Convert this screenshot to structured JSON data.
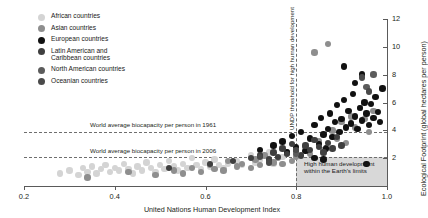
{
  "legend": {
    "items": [
      {
        "label": "African countries",
        "color": "#d4d4d4"
      },
      {
        "label": "Asian countries",
        "color": "#8e8e8e"
      },
      {
        "label": "European countries",
        "color": "#111111"
      },
      {
        "label": "Latin American and\nCaribbean countries",
        "color": "#3f3f3f"
      },
      {
        "label": "North American countries",
        "color": "#5c5c5c"
      },
      {
        "label": "Oceanian countries",
        "color": "#4a4a4a"
      }
    ]
  },
  "annotations": {
    "biocapacity_1961": "World average biocapacity per person in 1961",
    "biocapacity_2006": "World average biocapacity per person in 2006",
    "undp_threshold": "UNDP threshold for high human development",
    "sustainable_box": "High human development\nwithin the Earth's limits"
  },
  "chart_data": {
    "type": "scatter",
    "title": "",
    "xlabel": "United Nations Human Development Index",
    "ylabel": "Ecological Footprint (global hectares per person)",
    "xlim": [
      0.2,
      1.0
    ],
    "ylim": [
      0,
      12
    ],
    "xticks": [
      "0.2",
      "0.4",
      "0.6",
      "0.8",
      "1.0"
    ],
    "xtick_values": [
      0.2,
      0.4,
      0.6,
      0.8,
      1.0
    ],
    "yticks": [
      "2",
      "4",
      "6",
      "8",
      "10",
      "12"
    ],
    "ytick_values": [
      2,
      4,
      6,
      8,
      10,
      12
    ],
    "grid": false,
    "legend_position": "top-left",
    "reference_lines": [
      {
        "name": "World average biocapacity per person in 1961",
        "axis": "y",
        "value": 3.9,
        "style": "dashed"
      },
      {
        "name": "World average biocapacity per person in 2006",
        "axis": "y",
        "value": 2.1,
        "style": "dashed"
      },
      {
        "name": "UNDP threshold for high human development",
        "axis": "x",
        "value": 0.8,
        "style": "dashed"
      }
    ],
    "shaded_region": {
      "label": "High human development within the Earth's limits",
      "x_range": [
        0.8,
        1.0
      ],
      "y_range": [
        0,
        2.1
      ],
      "color": "#c9c9c9"
    },
    "series": [
      {
        "name": "African countries",
        "color": "#d4d4d4",
        "points": [
          [
            0.28,
            0.9
          ],
          [
            0.3,
            1.1
          ],
          [
            0.32,
            0.8
          ],
          [
            0.33,
            1.3
          ],
          [
            0.34,
            1.0
          ],
          [
            0.35,
            1.4
          ],
          [
            0.36,
            0.9
          ],
          [
            0.37,
            1.2
          ],
          [
            0.38,
            1.5
          ],
          [
            0.39,
            1.0
          ],
          [
            0.4,
            1.3
          ],
          [
            0.41,
            1.1
          ],
          [
            0.42,
            1.6
          ],
          [
            0.43,
            1.2
          ],
          [
            0.44,
            0.9
          ],
          [
            0.45,
            1.4
          ],
          [
            0.46,
            1.1
          ],
          [
            0.47,
            1.7
          ],
          [
            0.48,
            1.3
          ],
          [
            0.49,
            1.0
          ],
          [
            0.5,
            1.5
          ],
          [
            0.51,
            1.2
          ],
          [
            0.52,
            1.8
          ],
          [
            0.53,
            1.4
          ],
          [
            0.54,
            1.1
          ],
          [
            0.55,
            1.6
          ],
          [
            0.56,
            1.3
          ],
          [
            0.57,
            2.0
          ],
          [
            0.58,
            1.5
          ],
          [
            0.59,
            1.2
          ],
          [
            0.6,
            1.7
          ],
          [
            0.61,
            1.4
          ],
          [
            0.62,
            1.9
          ],
          [
            0.63,
            1.5
          ],
          [
            0.64,
            1.3
          ],
          [
            0.65,
            1.6
          ],
          [
            0.67,
            1.8
          ],
          [
            0.68,
            1.5
          ],
          [
            0.7,
            2.2
          ],
          [
            0.71,
            1.7
          ],
          [
            0.72,
            1.9
          ],
          [
            0.74,
            2.4
          ],
          [
            0.75,
            1.6
          ],
          [
            0.77,
            2.1
          ],
          [
            0.8,
            2.6
          ]
        ]
      },
      {
        "name": "Asian countries",
        "color": "#8e8e8e",
        "points": [
          [
            0.34,
            0.6
          ],
          [
            0.43,
            1.0
          ],
          [
            0.49,
            0.8
          ],
          [
            0.53,
            1.1
          ],
          [
            0.55,
            0.9
          ],
          [
            0.57,
            1.3
          ],
          [
            0.59,
            1.0
          ],
          [
            0.61,
            1.5
          ],
          [
            0.62,
            1.2
          ],
          [
            0.64,
            1.1
          ],
          [
            0.65,
            1.8
          ],
          [
            0.67,
            1.4
          ],
          [
            0.68,
            1.6
          ],
          [
            0.7,
            1.3
          ],
          [
            0.71,
            1.9
          ],
          [
            0.72,
            1.5
          ],
          [
            0.73,
            2.2
          ],
          [
            0.75,
            1.7
          ],
          [
            0.76,
            2.0
          ],
          [
            0.77,
            1.6
          ],
          [
            0.78,
            2.4
          ],
          [
            0.79,
            1.8
          ],
          [
            0.8,
            2.1
          ],
          [
            0.82,
            2.8
          ],
          [
            0.83,
            2.3
          ],
          [
            0.85,
            3.2
          ],
          [
            0.86,
            2.6
          ],
          [
            0.88,
            4.0
          ],
          [
            0.89,
            3.4
          ],
          [
            0.9,
            4.6
          ],
          [
            0.91,
            3.1
          ],
          [
            0.92,
            5.0
          ],
          [
            0.93,
            4.2
          ],
          [
            0.94,
            5.6
          ],
          [
            0.95,
            4.8
          ],
          [
            0.87,
            10.2
          ],
          [
            0.84,
            9.6
          ],
          [
            0.96,
            3.9
          ],
          [
            0.97,
            5.4
          ]
        ]
      },
      {
        "name": "European countries",
        "color": "#111111",
        "points": [
          [
            0.72,
            2.6
          ],
          [
            0.75,
            2.9
          ],
          [
            0.77,
            3.2
          ],
          [
            0.78,
            2.4
          ],
          [
            0.79,
            3.6
          ],
          [
            0.8,
            2.8
          ],
          [
            0.81,
            3.9
          ],
          [
            0.82,
            2.5
          ],
          [
            0.83,
            3.4
          ],
          [
            0.84,
            4.4
          ],
          [
            0.85,
            3.0
          ],
          [
            0.855,
            4.9
          ],
          [
            0.86,
            3.7
          ],
          [
            0.865,
            2.7
          ],
          [
            0.87,
            4.1
          ],
          [
            0.875,
            5.2
          ],
          [
            0.88,
            3.5
          ],
          [
            0.885,
            4.6
          ],
          [
            0.89,
            5.8
          ],
          [
            0.895,
            3.9
          ],
          [
            0.9,
            4.8
          ],
          [
            0.905,
            6.2
          ],
          [
            0.91,
            4.2
          ],
          [
            0.915,
            5.4
          ],
          [
            0.92,
            4.5
          ],
          [
            0.925,
            6.6
          ],
          [
            0.93,
            5.0
          ],
          [
            0.935,
            4.1
          ],
          [
            0.94,
            5.6
          ],
          [
            0.945,
            4.7
          ],
          [
            0.95,
            6.0
          ],
          [
            0.955,
            5.2
          ],
          [
            0.96,
            4.4
          ],
          [
            0.965,
            5.9
          ],
          [
            0.97,
            4.9
          ],
          [
            0.975,
            6.4
          ],
          [
            0.98,
            5.3
          ],
          [
            0.985,
            4.6
          ],
          [
            0.99,
            7.0
          ],
          [
            0.945,
            8.0
          ],
          [
            0.93,
            7.4
          ],
          [
            0.905,
            8.6
          ],
          [
            0.955,
            1.6
          ],
          [
            0.86,
            1.9
          ],
          [
            0.84,
            2.0
          ]
        ]
      },
      {
        "name": "Latin American and Caribbean countries",
        "color": "#3f3f3f",
        "points": [
          [
            0.52,
            1.3
          ],
          [
            0.61,
            1.6
          ],
          [
            0.66,
            1.8
          ],
          [
            0.7,
            2.0
          ],
          [
            0.72,
            2.2
          ],
          [
            0.74,
            1.9
          ],
          [
            0.75,
            2.4
          ],
          [
            0.76,
            2.1
          ],
          [
            0.77,
            2.7
          ],
          [
            0.78,
            2.3
          ],
          [
            0.79,
            3.0
          ],
          [
            0.8,
            2.5
          ],
          [
            0.81,
            2.2
          ],
          [
            0.82,
            2.9
          ],
          [
            0.83,
            2.6
          ],
          [
            0.84,
            3.3
          ],
          [
            0.85,
            2.8
          ],
          [
            0.86,
            2.4
          ],
          [
            0.87,
            3.1
          ],
          [
            0.88,
            2.7
          ],
          [
            0.89,
            3.5
          ],
          [
            0.9,
            2.9
          ]
        ]
      },
      {
        "name": "North American countries",
        "color": "#5c5c5c",
        "points": [
          [
            0.955,
            7.1
          ],
          [
            0.97,
            8.0
          ],
          [
            0.8,
            2.3
          ]
        ]
      },
      {
        "name": "Oceanian countries",
        "color": "#4a4a4a",
        "points": [
          [
            0.74,
            1.7
          ],
          [
            0.8,
            2.6
          ],
          [
            0.945,
            7.8
          ],
          [
            0.96,
            6.8
          ],
          [
            0.72,
            2.1
          ]
        ]
      }
    ]
  }
}
